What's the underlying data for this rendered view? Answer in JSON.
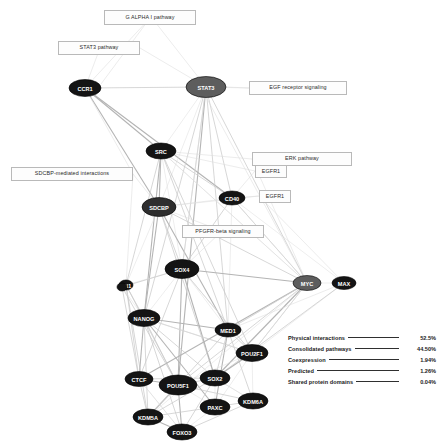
{
  "view": {
    "title": "Gene interaction network",
    "background_color": "#ffffff",
    "node_color": "#0b0b0b",
    "node_label_color": "#ffffff",
    "edge_color": "#c9c9c9"
  },
  "chart_data": {
    "type": "diagram",
    "nodes": [
      {
        "id": "CCR1",
        "label": "CCR1",
        "x": 85,
        "y": 88,
        "rx": 16,
        "ry": 8.5,
        "shade": "dark"
      },
      {
        "id": "STAT3",
        "label": "STAT3",
        "x": 206,
        "y": 87,
        "rx": 20,
        "ry": 10.5,
        "shade": "grey"
      },
      {
        "id": "SRC",
        "label": "SRC",
        "x": 161,
        "y": 151,
        "rx": 15,
        "ry": 8,
        "shade": "dark"
      },
      {
        "id": "SDCBP",
        "label": "SDCBP",
        "x": 159,
        "y": 207,
        "rx": 17,
        "ry": 9.5,
        "shade": "mid"
      },
      {
        "id": "CD40",
        "label": "CD40",
        "x": 232,
        "y": 198,
        "rx": 13,
        "ry": 7,
        "shade": "dark"
      },
      {
        "id": "SOX4",
        "label": "SOX4",
        "x": 182,
        "y": 269,
        "rx": 17,
        "ry": 9.5,
        "shade": "dark"
      },
      {
        "id": "PN1",
        "label": "PN1",
        "x": 126,
        "y": 285,
        "rx": 7,
        "ry": 5,
        "shade": "dark"
      },
      {
        "id": "NANOG",
        "label": "NANOG",
        "x": 144,
        "y": 318,
        "rx": 16,
        "ry": 8.5,
        "shade": "dark"
      },
      {
        "id": "MED1",
        "label": "MED1",
        "x": 228,
        "y": 330,
        "rx": 13,
        "ry": 7,
        "shade": "dark"
      },
      {
        "id": "MYC",
        "label": "MYC",
        "x": 307,
        "y": 283,
        "rx": 14,
        "ry": 7.5,
        "shade": "grey"
      },
      {
        "id": "MAX",
        "label": "MAX",
        "x": 344,
        "y": 283,
        "rx": 12,
        "ry": 6.5,
        "shade": "dark"
      },
      {
        "id": "SP1",
        "label": "",
        "x": 122,
        "y": 287,
        "rx": 5,
        "ry": 4,
        "shade": "dark"
      },
      {
        "id": "POU2F1",
        "label": "POU2F1",
        "x": 252,
        "y": 353,
        "rx": 16,
        "ry": 8.5,
        "shade": "dark"
      },
      {
        "id": "CTCF",
        "label": "CTCF",
        "x": 139,
        "y": 379,
        "rx": 14,
        "ry": 7.5,
        "shade": "dark"
      },
      {
        "id": "POU5F1",
        "label": "POU5F1",
        "x": 178,
        "y": 385,
        "rx": 19,
        "ry": 10,
        "shade": "dark"
      },
      {
        "id": "SOX2",
        "label": "SOX2",
        "x": 215,
        "y": 378,
        "rx": 15,
        "ry": 8,
        "shade": "dark"
      },
      {
        "id": "KDM6A",
        "label": "KDM6A",
        "x": 253,
        "y": 401,
        "rx": 15,
        "ry": 8,
        "shade": "dark"
      },
      {
        "id": "PAX6",
        "label": "PAXC",
        "x": 215,
        "y": 407,
        "rx": 15,
        "ry": 8,
        "shade": "dark"
      },
      {
        "id": "KDM5A",
        "label": "KDM5A",
        "x": 148,
        "y": 417,
        "rx": 15,
        "ry": 8,
        "shade": "dark"
      },
      {
        "id": "FOXO3",
        "label": "FOXO3",
        "x": 182,
        "y": 432,
        "rx": 15,
        "ry": 8,
        "shade": "dark"
      }
    ],
    "edge_count": 120,
    "legend": {
      "position": "bottom-right",
      "entries": [
        {
          "label": "Physical interactions",
          "percent": "52.5%"
        },
        {
          "label": "Consolidated pathways",
          "percent": "44.50%"
        },
        {
          "label": "Coexpression",
          "percent": "1.94%"
        },
        {
          "label": "Predicted",
          "percent": "1.26%"
        },
        {
          "label": "Shared protein domains",
          "percent": "0.04%"
        }
      ]
    },
    "annotations": [
      {
        "id": "galpha",
        "label": "G ALPHA I pathway"
      },
      {
        "id": "stat3",
        "label": "STAT3 pathway"
      },
      {
        "id": "egf",
        "label": "EGF receptor signaling"
      },
      {
        "id": "erk",
        "label": "ERK pathway"
      },
      {
        "id": "egfr1a",
        "label": "EGFR1"
      },
      {
        "id": "egfr1b",
        "label": "EGFR1"
      },
      {
        "id": "sdcbp",
        "label": "SDCBP-mediated interactions"
      },
      {
        "id": "pdgfr",
        "label": "PFGFR-beta signaling"
      }
    ]
  },
  "annotations": {
    "galpha": {
      "label": "G ALPHA I pathway"
    },
    "stat3": {
      "label": "STAT3 pathway"
    },
    "egf": {
      "label": "EGF receptor signaling"
    },
    "erk": {
      "label": "ERK pathway"
    },
    "egfr1a": {
      "label": "EGFR1"
    },
    "egfr1b": {
      "label": "EGFR1"
    },
    "sdcbp": {
      "label": "SDCBP-mediated interactions"
    },
    "pdgfr": {
      "label": "PFGFR-beta signaling"
    }
  },
  "legend": {
    "rows": [
      {
        "label": "Physical interactions",
        "percent": "52.5%"
      },
      {
        "label": "Consolidated pathways",
        "percent": "44.50%"
      },
      {
        "label": "Coexpression",
        "percent": "1.94%"
      },
      {
        "label": "Predicted",
        "percent": "1.26%"
      },
      {
        "label": "Shared protein domains",
        "percent": "0.04%"
      }
    ]
  }
}
